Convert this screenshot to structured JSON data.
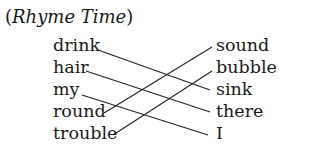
{
  "title": {
    "open_paren": "(",
    "text": "Rhyme Time",
    "close_paren": ")"
  },
  "left_words": [
    {
      "label": "drink",
      "x": 53,
      "y": 35
    },
    {
      "label": "hair",
      "x": 53,
      "y": 57
    },
    {
      "label": "my",
      "x": 53,
      "y": 79
    },
    {
      "label": "round",
      "x": 53,
      "y": 101
    },
    {
      "label": "trouble",
      "x": 53,
      "y": 123
    }
  ],
  "right_words": [
    {
      "label": "sound",
      "x": 216,
      "y": 35
    },
    {
      "label": "bubble",
      "x": 216,
      "y": 57
    },
    {
      "label": "sink",
      "x": 216,
      "y": 79
    },
    {
      "label": "there",
      "x": 216,
      "y": 101
    },
    {
      "label": "I",
      "x": 216,
      "y": 123
    }
  ],
  "matches": [
    {
      "from": "drink",
      "to": "sink",
      "x1": 98,
      "y1": 50,
      "x2": 210,
      "y2": 90
    },
    {
      "from": "hair",
      "to": "there",
      "x1": 86,
      "y1": 71,
      "x2": 210,
      "y2": 112
    },
    {
      "from": "my",
      "to": "I",
      "x1": 82,
      "y1": 95,
      "x2": 208,
      "y2": 135
    },
    {
      "from": "round",
      "to": "sound",
      "x1": 104,
      "y1": 113,
      "x2": 212,
      "y2": 47
    },
    {
      "from": "trouble",
      "to": "bubble",
      "x1": 113,
      "y1": 135,
      "x2": 212,
      "y2": 71
    }
  ],
  "line_color": "#222222"
}
